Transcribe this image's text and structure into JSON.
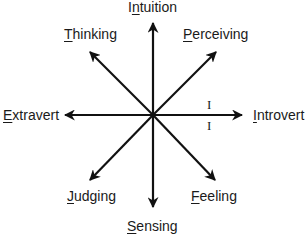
{
  "diagram": {
    "center": {
      "x": 153,
      "y": 115
    },
    "stroke_color": "#111111",
    "text_color": "#1a1a1a",
    "labels": {
      "intuition": {
        "accel": "I",
        "first": "",
        "accel_char": "n",
        "rest": "tuition",
        "full": "Intuition"
      },
      "thinking": {
        "first": "",
        "accel_char": "T",
        "rest": "hinking",
        "full": "Thinking"
      },
      "perceiving": {
        "first": "",
        "accel_char": "P",
        "rest": "erceiving",
        "full": "Perceiving"
      },
      "extravert": {
        "first": "",
        "accel_char": "E",
        "rest": "xtravert",
        "full": "Extravert"
      },
      "introvert": {
        "first": "",
        "accel_char": "I",
        "rest": "ntrovert",
        "full": "Introvert"
      },
      "judging": {
        "first": "",
        "accel_char": "J",
        "rest": "udging",
        "full": "Judging"
      },
      "feeling": {
        "first": "",
        "accel_char": "F",
        "rest": "eeling",
        "full": "Feeling"
      },
      "sensing": {
        "first": "",
        "accel_char": "S",
        "rest": "ensing",
        "full": "Sensing"
      }
    },
    "marks": {
      "introvert_top": "I",
      "introvert_bottom": "I"
    },
    "arrows": [
      {
        "name": "intuition",
        "x2": 153,
        "y2": 23
      },
      {
        "name": "sensing",
        "x2": 153,
        "y2": 207
      },
      {
        "name": "extravert",
        "x2": 65,
        "y2": 115
      },
      {
        "name": "introvert",
        "x2": 242,
        "y2": 115
      },
      {
        "name": "thinking",
        "x2": 90,
        "y2": 52
      },
      {
        "name": "perceiving",
        "x2": 216,
        "y2": 52
      },
      {
        "name": "judging",
        "x2": 90,
        "y2": 180
      },
      {
        "name": "feeling",
        "x2": 215,
        "y2": 180
      }
    ]
  }
}
